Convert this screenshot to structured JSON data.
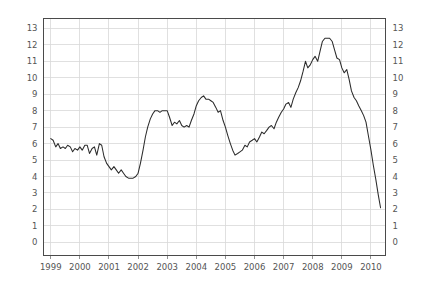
{
  "chart_data": {
    "type": "line",
    "title": "",
    "subtitle": "",
    "xlabel": "",
    "ylabel": "",
    "grid": true,
    "legend": false,
    "legend_position": "none",
    "x_axis": {
      "tick_labels": [
        "1999",
        "2000",
        "2001",
        "2002",
        "2003",
        "2004",
        "2005",
        "2006",
        "2007",
        "2008",
        "2009",
        "2010"
      ],
      "tick_values": [
        1999,
        2000,
        2001,
        2002,
        2003,
        2004,
        2005,
        2006,
        2007,
        2008,
        2009,
        2010
      ],
      "xlim": [
        1998.75,
        2010.5
      ]
    },
    "y_axis": {
      "tick_labels": [
        "0",
        "1",
        "2",
        "3",
        "4",
        "5",
        "6",
        "7",
        "8",
        "9",
        "10",
        "11",
        "12",
        "13"
      ],
      "tick_values": [
        0,
        1,
        2,
        3,
        4,
        5,
        6,
        7,
        8,
        9,
        10,
        11,
        12,
        13
      ],
      "ylim": [
        -0.8,
        13.6
      ],
      "mirrored_right_axis": true
    },
    "series": [
      {
        "name": "series-1",
        "color": "#2b2b2b",
        "x": [
          1999.0,
          1999.08,
          1999.17,
          1999.25,
          1999.33,
          1999.42,
          1999.5,
          1999.58,
          1999.67,
          1999.75,
          1999.83,
          1999.92,
          2000.0,
          2000.08,
          2000.17,
          2000.25,
          2000.33,
          2000.42,
          2000.5,
          2000.58,
          2000.67,
          2000.75,
          2000.83,
          2000.92,
          2001.0,
          2001.08,
          2001.17,
          2001.25,
          2001.33,
          2001.42,
          2001.5,
          2001.58,
          2001.67,
          2001.75,
          2001.83,
          2001.92,
          2002.0,
          2002.08,
          2002.17,
          2002.25,
          2002.33,
          2002.42,
          2002.5,
          2002.58,
          2002.67,
          2002.75,
          2002.83,
          2002.92,
          2003.0,
          2003.08,
          2003.17,
          2003.25,
          2003.33,
          2003.42,
          2003.5,
          2003.58,
          2003.67,
          2003.75,
          2003.83,
          2003.92,
          2004.0,
          2004.08,
          2004.17,
          2004.25,
          2004.33,
          2004.42,
          2004.5,
          2004.58,
          2004.67,
          2004.75,
          2004.83,
          2004.92,
          2005.0,
          2005.08,
          2005.17,
          2005.25,
          2005.33,
          2005.42,
          2005.5,
          2005.58,
          2005.67,
          2005.75,
          2005.83,
          2005.92,
          2006.0,
          2006.08,
          2006.17,
          2006.25,
          2006.33,
          2006.42,
          2006.5,
          2006.58,
          2006.67,
          2006.75,
          2006.83,
          2006.92,
          2007.0,
          2007.08,
          2007.17,
          2007.25,
          2007.33,
          2007.42,
          2007.5,
          2007.58,
          2007.67,
          2007.75,
          2007.83,
          2007.92,
          2008.0,
          2008.08,
          2008.17,
          2008.25,
          2008.33,
          2008.42,
          2008.5,
          2008.58,
          2008.67,
          2008.75,
          2008.83,
          2008.92,
          2009.0,
          2009.08,
          2009.17,
          2009.25,
          2009.33,
          2009.42,
          2009.5,
          2009.58,
          2009.67,
          2009.75,
          2009.83,
          2009.92,
          2010.0,
          2010.08,
          2010.17,
          2010.25,
          2010.33
        ],
        "y": [
          6.3,
          6.2,
          5.8,
          6.0,
          5.7,
          5.8,
          5.7,
          5.9,
          5.8,
          5.5,
          5.7,
          5.6,
          5.8,
          5.6,
          5.9,
          5.9,
          5.4,
          5.7,
          5.8,
          5.3,
          6.0,
          5.9,
          5.2,
          4.8,
          4.6,
          4.4,
          4.6,
          4.4,
          4.2,
          4.4,
          4.2,
          4.0,
          3.9,
          3.9,
          3.9,
          4.0,
          4.2,
          4.8,
          5.6,
          6.4,
          7.0,
          7.5,
          7.8,
          8.0,
          8.0,
          7.9,
          8.0,
          8.0,
          8.0,
          7.6,
          7.1,
          7.3,
          7.2,
          7.4,
          7.1,
          7.0,
          7.1,
          7.0,
          7.4,
          7.8,
          8.3,
          8.6,
          8.8,
          8.9,
          8.7,
          8.7,
          8.6,
          8.5,
          8.2,
          7.9,
          8.0,
          7.4,
          7.0,
          6.5,
          6.0,
          5.6,
          5.3,
          5.4,
          5.5,
          5.6,
          5.9,
          5.8,
          6.1,
          6.2,
          6.3,
          6.1,
          6.4,
          6.7,
          6.6,
          6.8,
          7.0,
          7.1,
          6.9,
          7.3,
          7.6,
          7.9,
          8.1,
          8.4,
          8.5,
          8.2,
          8.7,
          9.1,
          9.4,
          9.8,
          10.4,
          11.0,
          10.6,
          10.8,
          11.1,
          11.3,
          11.0,
          11.6,
          12.2,
          12.4,
          12.4,
          12.4,
          12.2,
          11.7,
          11.2,
          11.1,
          10.6,
          10.3,
          10.5,
          9.9,
          9.2,
          8.8,
          8.6,
          8.3,
          8.0,
          7.7,
          7.3,
          6.4,
          5.6,
          4.7,
          3.8,
          2.9,
          2.1
        ]
      }
    ],
    "annotations": []
  },
  "colors": {
    "line": "#2b2b2b",
    "grid": "#d8d8d8",
    "frame": "#4a4a4a",
    "tick_text": "#555555",
    "background": "#ffffff"
  }
}
